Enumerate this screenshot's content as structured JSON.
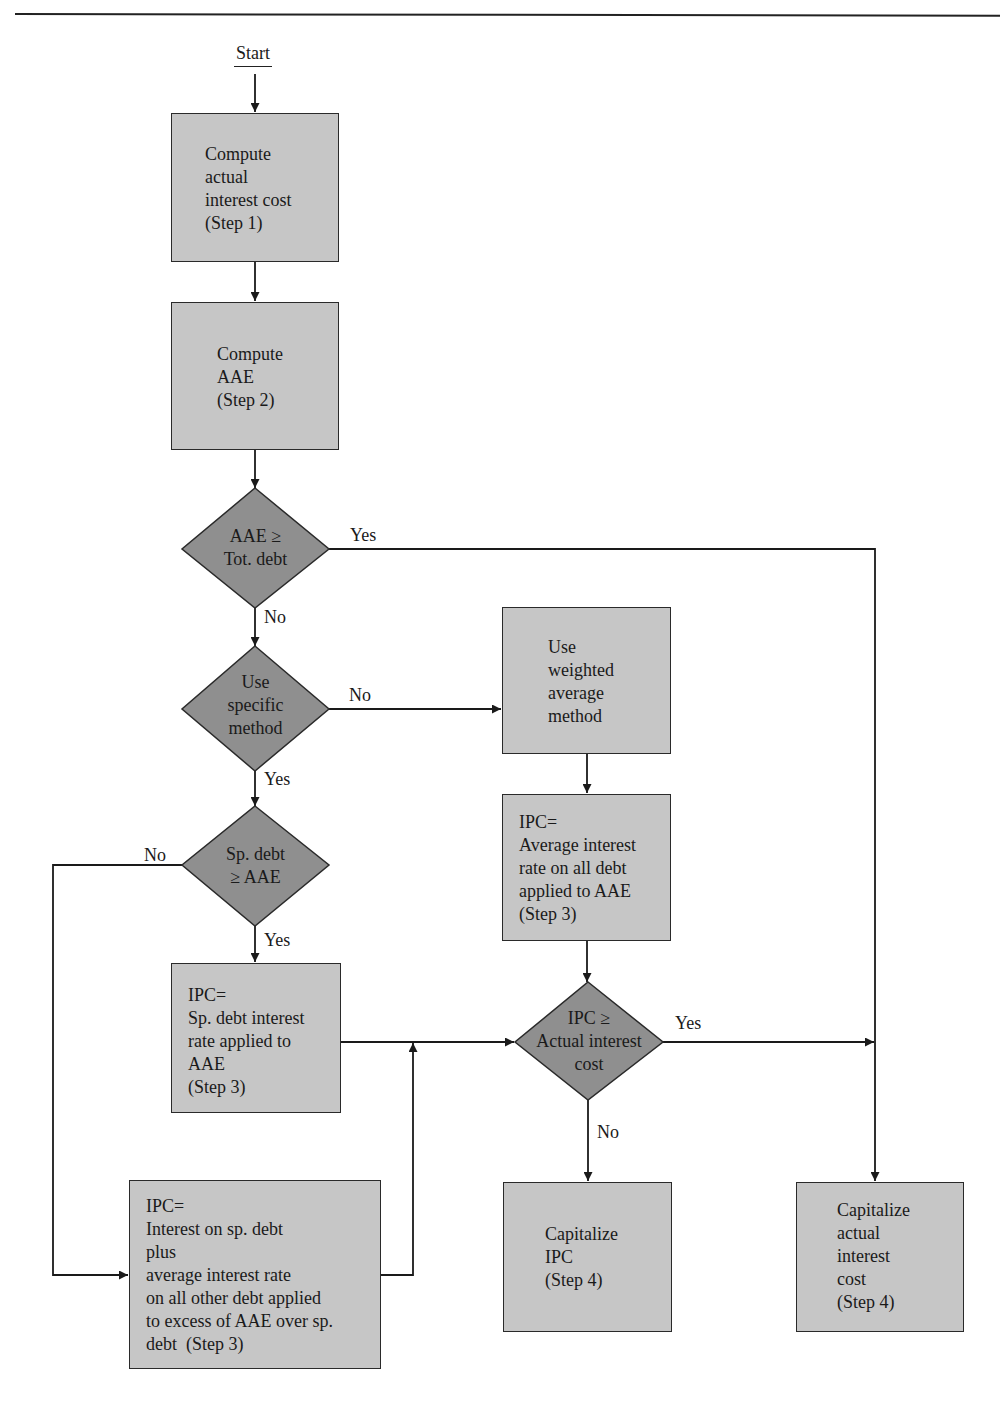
{
  "diagram": {
    "start_label": "Start",
    "colors": {
      "process_fill": "#c6c6c6",
      "decision_fill": "#8f8f8f",
      "line": "#1a1a1a"
    },
    "nodes": {
      "step1": {
        "type": "process",
        "text": "Compute\nactual\ninterest cost\n(Step 1)"
      },
      "step2": {
        "type": "process",
        "text": "Compute\nAAE\n(Step 2)"
      },
      "d_aae_totdebt": {
        "type": "decision",
        "text": "AAE ≥\nTot. debt"
      },
      "d_specific": {
        "type": "decision",
        "text": "Use\nspecific\nmethod"
      },
      "weighted": {
        "type": "process",
        "text": "Use\nweighted\naverage\nmethod"
      },
      "d_spdebt": {
        "type": "decision",
        "text": "Sp. debt\n≥ AAE"
      },
      "ipc_weighted": {
        "type": "process",
        "text": "IPC=\nAverage interest\nrate on all debt\napplied to AAE\n(Step 3)"
      },
      "ipc_sp": {
        "type": "process",
        "text": "IPC=\nSp. debt interest\nrate applied to\nAAE\n(Step 3)"
      },
      "d_ipc_actual": {
        "type": "decision",
        "text": "IPC ≥\nActual interest\ncost"
      },
      "ipc_mixed": {
        "type": "process",
        "text": "IPC=\nInterest on sp. debt\nplus\naverage interest rate\non all other debt applied\nto excess of AAE over sp.\ndebt  (Step 3)"
      },
      "cap_ipc": {
        "type": "process",
        "text": "Capitalize\nIPC\n(Step 4)"
      },
      "cap_actual": {
        "type": "process",
        "text": "Capitalize\nactual\ninterest\ncost\n(Step 4)"
      }
    },
    "edge_labels": {
      "aae_yes": "Yes",
      "aae_no": "No",
      "specific_no": "No",
      "specific_yes": "Yes",
      "spdebt_no": "No",
      "spdebt_yes": "Yes",
      "ipc_yes": "Yes",
      "ipc_no": "No"
    },
    "edges": [
      {
        "from": "start",
        "to": "step1"
      },
      {
        "from": "step1",
        "to": "step2"
      },
      {
        "from": "step2",
        "to": "d_aae_totdebt"
      },
      {
        "from": "d_aae_totdebt",
        "to": "cap_actual",
        "label": "Yes"
      },
      {
        "from": "d_aae_totdebt",
        "to": "d_specific",
        "label": "No"
      },
      {
        "from": "d_specific",
        "to": "weighted",
        "label": "No"
      },
      {
        "from": "d_specific",
        "to": "d_spdebt",
        "label": "Yes"
      },
      {
        "from": "weighted",
        "to": "ipc_weighted"
      },
      {
        "from": "d_spdebt",
        "to": "ipc_sp",
        "label": "Yes"
      },
      {
        "from": "d_spdebt",
        "to": "ipc_mixed",
        "label": "No"
      },
      {
        "from": "ipc_weighted",
        "to": "d_ipc_actual"
      },
      {
        "from": "ipc_sp",
        "to": "d_ipc_actual"
      },
      {
        "from": "ipc_mixed",
        "to": "d_ipc_actual"
      },
      {
        "from": "d_ipc_actual",
        "to": "cap_actual",
        "label": "Yes"
      },
      {
        "from": "d_ipc_actual",
        "to": "cap_ipc",
        "label": "No"
      }
    ]
  }
}
